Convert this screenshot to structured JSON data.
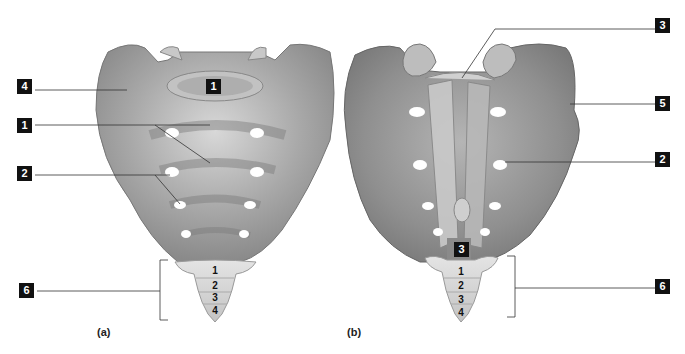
{
  "figure": {
    "panels": [
      {
        "caption": "(a)",
        "view": "anterior",
        "labels": [
          {
            "id": "4",
            "target": "ala"
          },
          {
            "id": "1",
            "target": "base / body (superior)"
          },
          {
            "id": "1",
            "target": "transverse ridges / body"
          },
          {
            "id": "2",
            "target": "anterior sacral foramina"
          },
          {
            "id": "6",
            "target": "coccyx"
          }
        ],
        "coccyx_segments": [
          "1",
          "2",
          "3",
          "4"
        ]
      },
      {
        "caption": "(b)",
        "view": "posterior",
        "labels": [
          {
            "id": "3",
            "target": "sacral canal (superior opening)"
          },
          {
            "id": "5",
            "target": "auricular surface / lateral"
          },
          {
            "id": "2",
            "target": "posterior sacral foramina"
          },
          {
            "id": "3",
            "target": "sacral hiatus"
          },
          {
            "id": "6",
            "target": "coccyx"
          }
        ],
        "coccyx_segments": [
          "1",
          "2",
          "3",
          "4"
        ]
      }
    ]
  },
  "tags": {
    "a_4": "4",
    "a_1_top": "1",
    "a_1": "1",
    "a_2": "2",
    "a_6": "6",
    "b_3_top": "3",
    "b_5": "5",
    "b_2": "2",
    "b_3_bottom": "3",
    "b_6": "6"
  },
  "captions": {
    "a": "(a)",
    "b": "(b)"
  },
  "coccyx": {
    "a": [
      "1",
      "2",
      "3",
      "4"
    ],
    "b": [
      "1",
      "2",
      "3",
      "4"
    ]
  }
}
